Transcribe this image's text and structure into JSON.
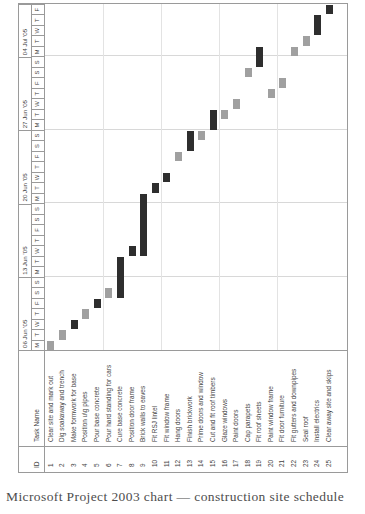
{
  "figure": {
    "caption": "Microsoft Project 2003 chart — construction site schedule",
    "columns": {
      "id_header": "ID",
      "name_header": "Task Name"
    },
    "colors": {
      "normal_bar": "#a0a0a0",
      "critical_bar": "#2e2e2e",
      "grid": "#9a9a9a"
    }
  },
  "chart_data": {
    "type": "bar",
    "xlabel": "",
    "ylabel": "",
    "grid": true,
    "legend_position": "none",
    "timescale": {
      "weeks": [
        "06 Jun '05",
        "13 Jun '05",
        "20 Jun '05",
        "27 Jun '05",
        "04 Jul '05"
      ],
      "day_letters": [
        "M",
        "T",
        "W",
        "T",
        "F",
        "S",
        "S"
      ],
      "last_week_day_letters": [
        "M",
        "T",
        "W",
        "T",
        "F"
      ],
      "total_days": 33,
      "start_date": "06 Jun '05",
      "end_date": "08 Jul '05"
    },
    "categories": [
      "Clear site and mark out",
      "Dig soakaway and trench",
      "Make formwork for base",
      "Position u\\g pipes",
      "Pour base concrete",
      "Pour hard standing for cars",
      "Cure base concrete",
      "Position door frame",
      "Brick walls to eaves",
      "Fit RSJ lintel",
      "Fit window frame",
      "Hang doors",
      "Finish brickwork",
      "Prime doors and window",
      "Cut and fit roof timbers",
      "Glaze windows",
      "Paint doors",
      "Cap parapets",
      "Fit roof sheets",
      "Paint window frame",
      "Fit door furniture",
      "Fit gutters and downpipes",
      "Seal roof",
      "Install electrics",
      "Clear away site and skips"
    ],
    "tasks": [
      {
        "id": "1",
        "name": "Clear site and mark out",
        "start_day": 0,
        "duration": 1,
        "critical": false
      },
      {
        "id": "2",
        "name": "Dig soakaway and trench",
        "start_day": 1,
        "duration": 1,
        "critical": false
      },
      {
        "id": "3",
        "name": "Make formwork for base",
        "start_day": 2,
        "duration": 1,
        "critical": true
      },
      {
        "id": "4",
        "name": "Position u\\g pipes",
        "start_day": 3,
        "duration": 1,
        "critical": false
      },
      {
        "id": "5",
        "name": "Pour base concrete",
        "start_day": 4,
        "duration": 1,
        "critical": true
      },
      {
        "id": "6",
        "name": "Pour hard standing for cars",
        "start_day": 5,
        "duration": 1,
        "critical": false
      },
      {
        "id": "7",
        "name": "Cure base concrete",
        "start_day": 5,
        "duration": 4,
        "critical": true
      },
      {
        "id": "8",
        "name": "Position door frame",
        "start_day": 9,
        "duration": 1,
        "critical": true
      },
      {
        "id": "9",
        "name": "Brick walls to eaves",
        "start_day": 9,
        "duration": 6,
        "critical": true
      },
      {
        "id": "10",
        "name": "Fit RSJ lintel",
        "start_day": 15,
        "duration": 1,
        "critical": true
      },
      {
        "id": "11",
        "name": "Fit window frame",
        "start_day": 16,
        "duration": 1,
        "critical": true
      },
      {
        "id": "12",
        "name": "Hang doors",
        "start_day": 18,
        "duration": 1,
        "critical": false
      },
      {
        "id": "13",
        "name": "Finish brickwork",
        "start_day": 19,
        "duration": 2,
        "critical": true
      },
      {
        "id": "14",
        "name": "Prime doors and window",
        "start_day": 20,
        "duration": 1,
        "critical": false
      },
      {
        "id": "15",
        "name": "Cut and fit roof timbers",
        "start_day": 21,
        "duration": 2,
        "critical": true
      },
      {
        "id": "16",
        "name": "Glaze windows",
        "start_day": 22,
        "duration": 1,
        "critical": false
      },
      {
        "id": "17",
        "name": "Paint doors",
        "start_day": 23,
        "duration": 1,
        "critical": false
      },
      {
        "id": "18",
        "name": "Cap parapets",
        "start_day": 26,
        "duration": 1,
        "critical": false
      },
      {
        "id": "19",
        "name": "Fit roof sheets",
        "start_day": 27,
        "duration": 2,
        "critical": true
      },
      {
        "id": "20",
        "name": "Paint window frame",
        "start_day": 24,
        "duration": 1,
        "critical": false
      },
      {
        "id": "21",
        "name": "Fit door furniture",
        "start_day": 25,
        "duration": 1,
        "critical": false
      },
      {
        "id": "22",
        "name": "Fit gutters and downpipes",
        "start_day": 28,
        "duration": 1,
        "critical": false
      },
      {
        "id": "23",
        "name": "Seal roof",
        "start_day": 29,
        "duration": 1,
        "critical": false
      },
      {
        "id": "24",
        "name": "Install electrics",
        "start_day": 30,
        "duration": 2,
        "critical": true
      },
      {
        "id": "25",
        "name": "Clear away site and skips",
        "start_day": 32,
        "duration": 1,
        "critical": true
      }
    ]
  }
}
